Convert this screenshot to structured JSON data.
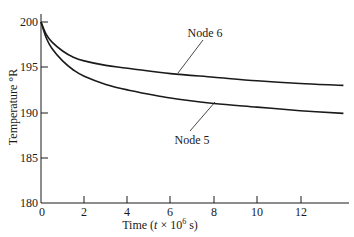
{
  "chart_data": {
    "type": "line",
    "title": "",
    "xlabel": "Time (t × 10⁶ s)",
    "ylabel": "Temperature °R",
    "xlim": [
      0,
      14
    ],
    "ylim": [
      180,
      200
    ],
    "x_ticks": [
      0,
      2,
      4,
      6,
      8,
      10,
      12
    ],
    "y_ticks": [
      180,
      185,
      190,
      195,
      200
    ],
    "grid": false,
    "legend": "none (inline annotations)",
    "x": [
      0,
      0.25,
      0.5,
      1,
      1.5,
      2,
      3,
      4,
      6,
      8,
      10,
      12,
      14
    ],
    "series": [
      {
        "name": "Node 6",
        "values": [
          200,
          198.6,
          197.8,
          196.8,
          196.1,
          195.7,
          195.2,
          194.9,
          194.3,
          193.9,
          193.5,
          193.2,
          193.0
        ]
      },
      {
        "name": "Node 5",
        "values": [
          200,
          198.2,
          197.1,
          195.7,
          194.7,
          194.0,
          193.1,
          192.5,
          191.6,
          191.0,
          190.6,
          190.2,
          189.9
        ]
      }
    ],
    "annotations": [
      {
        "text": "Node 6",
        "points_to_series": "Node 6",
        "at_x": 3.9
      },
      {
        "text": "Node 5",
        "points_to_series": "Node 5",
        "at_x": 7.1
      }
    ]
  },
  "labels": {
    "xlabel_prefix": "Time (",
    "xlabel_var": "t",
    "xlabel_mid": " × 10",
    "xlabel_exp": "6",
    "xlabel_suffix": " s)",
    "ylabel": "Temperature °R",
    "node6": "Node 6",
    "node5": "Node 5",
    "xticks": [
      "0",
      "2",
      "4",
      "6",
      "8",
      "10",
      "12"
    ],
    "yticks": [
      "200",
      "195",
      "190",
      "185",
      "180"
    ]
  }
}
